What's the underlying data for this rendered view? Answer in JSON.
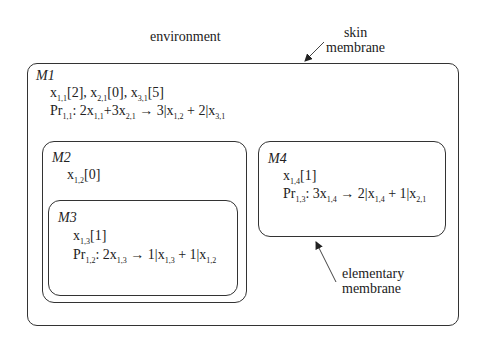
{
  "labels": {
    "environment": "environment",
    "skin_line1": "skin",
    "skin_line2": "membrane",
    "elem_line1": "elementary",
    "elem_line2": "membrane"
  },
  "membranes": {
    "m1": {
      "name": "M1",
      "objects": [
        {
          "var": "x",
          "sub": "1,1",
          "count": "[2]",
          "sep": ", "
        },
        {
          "var": "x",
          "sub": "2,1",
          "count": "[0]",
          "sep": ", "
        },
        {
          "var": "x",
          "sub": "3,1",
          "count": "[5]",
          "sep": ""
        }
      ],
      "rule": {
        "pr": "Pr",
        "pr_sub": "1,1",
        "colon": ": ",
        "l1": "2x",
        "l1_sub": "1,1",
        "l2": "+3x",
        "l2_sub": "2,1",
        "arrow": " → ",
        "r1": "3|x",
        "r1_sub": "1,2",
        "r2": " + 2|x",
        "r2_sub": "3,1"
      }
    },
    "m2": {
      "name": "M2",
      "objects": [
        {
          "var": "x",
          "sub": "1,2",
          "count": "[0]"
        }
      ]
    },
    "m3": {
      "name": "M3",
      "objects": [
        {
          "var": "x",
          "sub": "1,3",
          "count": "[1]"
        }
      ],
      "rule": {
        "pr": "Pr",
        "pr_sub": "1,2",
        "colon": ": ",
        "l1": "2x",
        "l1_sub": "1,3",
        "arrow": " → ",
        "r1": "1|x",
        "r1_sub": "1,3",
        "r2": " + 1|x",
        "r2_sub": "1,2"
      }
    },
    "m4": {
      "name": "M4",
      "objects": [
        {
          "var": "x",
          "sub": "1,4",
          "count": "[1]"
        }
      ],
      "rule": {
        "pr": "Pr",
        "pr_sub": "1,3",
        "colon": ": ",
        "l1": "3x",
        "l1_sub": "1,4",
        "arrow": " → ",
        "r1": "2|x",
        "r1_sub": "1,4",
        "r2": " + 1|x",
        "r2_sub": "2,1"
      }
    }
  }
}
